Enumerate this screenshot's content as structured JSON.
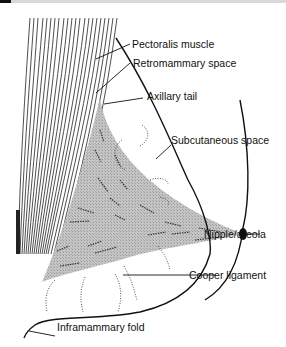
{
  "diagram": {
    "labels": {
      "pectoralis": "Pectoralis muscle",
      "retromammary": "Retromammary space",
      "axillary": "Axillary tail",
      "subcutaneous": "Subcutaneous space",
      "nipple": "Nipple/areola",
      "cooper": "Cooper ligament",
      "inframammary": "Inframammary fold"
    },
    "colors": {
      "line": "#111111",
      "gland_fill": "#bdbdbd",
      "background": "#ffffff"
    }
  }
}
